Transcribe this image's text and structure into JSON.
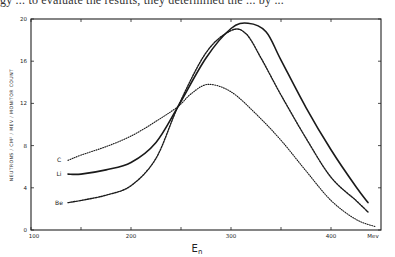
{
  "page": {
    "cropped_text_line": "gy ... to evaluate the results, they determined the ... by ..."
  },
  "chart_data": {
    "type": "line",
    "title": "",
    "xlabel": "E",
    "xlabel_subscript": "n",
    "x_unit": "Mev",
    "ylabel": "NEUTRONS / CM² / MEV / MONITOR COUNT",
    "xlim": [
      100,
      450
    ],
    "ylim": [
      0,
      20
    ],
    "x_ticks": [
      100,
      150,
      200,
      250,
      300,
      350,
      400
    ],
    "x_tick_labels": [
      "100",
      "",
      "200",
      "",
      "300",
      "",
      "400"
    ],
    "y_ticks": [
      0,
      4,
      8,
      12,
      16,
      20
    ],
    "y_tick_labels": [
      "0",
      "4",
      "8",
      "12",
      "16",
      "20"
    ],
    "grid": false,
    "legend_position": "inline-left",
    "series": [
      {
        "name": "C",
        "style": "dotted",
        "x": [
          137,
          150,
          175,
          200,
          225,
          247,
          260,
          277,
          300,
          325,
          350,
          375,
          400,
          425,
          445
        ],
        "values": [
          6.6,
          7.1,
          7.9,
          8.9,
          10.3,
          11.7,
          12.9,
          13.8,
          13.1,
          11.0,
          8.5,
          5.6,
          2.8,
          1.0,
          0.3
        ]
      },
      {
        "name": "Li",
        "style": "solid",
        "x": [
          137,
          150,
          175,
          200,
          225,
          247,
          275,
          300,
          317,
          335,
          350,
          375,
          400,
          425,
          437
        ],
        "values": [
          5.3,
          5.3,
          5.7,
          6.4,
          8.3,
          11.7,
          16.3,
          19.1,
          19.6,
          18.8,
          16.1,
          11.6,
          7.6,
          4.1,
          2.6
        ]
      },
      {
        "name": "Be",
        "style": "dashed",
        "x": [
          137,
          150,
          175,
          200,
          225,
          247,
          275,
          300,
          315,
          330,
          350,
          375,
          400,
          425,
          437
        ],
        "values": [
          2.6,
          2.8,
          3.3,
          4.2,
          6.8,
          11.7,
          16.8,
          18.9,
          18.6,
          16.3,
          12.8,
          8.7,
          5.0,
          2.8,
          1.7
        ]
      }
    ]
  },
  "labels": {
    "C": "C",
    "Li": "Li",
    "Be": "Be",
    "x_unit": "Mev",
    "x_main": "E",
    "x_sub": "n"
  }
}
